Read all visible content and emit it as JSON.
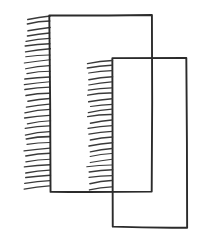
{
  "figure": {
    "style": "hand-drawn line art",
    "background_color": "#ffffff",
    "stroke_color": "#2b2b2b",
    "hatch_color": "#3a3a3a",
    "canvas": {
      "width": 204,
      "height": 238
    }
  },
  "shapes": [
    {
      "name": "rectangle-back",
      "label": "Back rectangle (larger, upper-left)",
      "x": 50,
      "y": 15,
      "width": 102,
      "height": 177,
      "stroke_width": 1.9,
      "hatching": {
        "edge": "left",
        "direction": "outward-left",
        "count": 32,
        "length": 24,
        "spacing": 5.5,
        "start_y": 16,
        "droop": 2.6,
        "stroke_width": 1.35
      }
    },
    {
      "name": "rectangle-front",
      "label": "Front rectangle (smaller, lower-right)",
      "x": 112,
      "y": 58,
      "width": 75,
      "height": 169,
      "stroke_width": 1.9,
      "hatching": {
        "edge": "left",
        "direction": "outward-left",
        "count": 24,
        "length": 23,
        "spacing": 5.5,
        "start_y": 60,
        "droop": 2.6,
        "stroke_width": 1.35
      }
    }
  ]
}
